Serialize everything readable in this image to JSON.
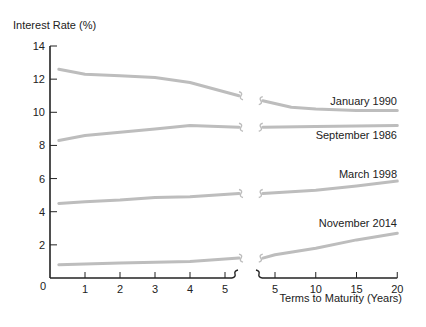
{
  "chart_data": {
    "type": "line",
    "title": "",
    "ylabel": "Interest Rate (%)",
    "xlabel": "Terms to Maturity (Years)",
    "ylim": [
      0,
      14
    ],
    "yticks": [
      0,
      2,
      4,
      6,
      8,
      10,
      12,
      14
    ],
    "x_segments": [
      {
        "range": [
          0,
          5.5
        ],
        "ticks": [
          1,
          2,
          3,
          4,
          5
        ]
      },
      {
        "range": [
          3.5,
          20
        ],
        "ticks": [
          5,
          10,
          15,
          20
        ]
      }
    ],
    "axis_break": true,
    "grid": false,
    "line_color": "#bdbdbd",
    "series": [
      {
        "name": "January 1990",
        "left": {
          "x": [
            0.25,
            1,
            2,
            3,
            4,
            5.4
          ],
          "y": [
            12.6,
            12.3,
            12.2,
            12.1,
            11.8,
            11.0
          ]
        },
        "right": {
          "x": [
            3.5,
            7,
            10,
            15,
            20
          ],
          "y": [
            10.7,
            10.3,
            10.2,
            10.1,
            10.1
          ]
        },
        "label_pos": {
          "x": 397,
          "y": 105,
          "anchor": "end"
        }
      },
      {
        "name": "September 1986",
        "left": {
          "x": [
            0.25,
            1,
            2,
            3,
            4,
            5.4
          ],
          "y": [
            8.3,
            8.6,
            8.8,
            9.0,
            9.2,
            9.1
          ]
        },
        "right": {
          "x": [
            3.5,
            10,
            20
          ],
          "y": [
            9.1,
            9.15,
            9.2
          ]
        },
        "label_pos": {
          "x": 397,
          "y": 139,
          "anchor": "end"
        }
      },
      {
        "name": "March 1998",
        "left": {
          "x": [
            0.25,
            1,
            2,
            3,
            4,
            5.4
          ],
          "y": [
            4.5,
            4.6,
            4.7,
            4.85,
            4.9,
            5.1
          ]
        },
        "right": {
          "x": [
            3.5,
            7,
            10,
            15,
            20
          ],
          "y": [
            5.1,
            5.2,
            5.3,
            5.55,
            5.85
          ]
        },
        "label_pos": {
          "x": 397,
          "y": 178,
          "anchor": "end"
        }
      },
      {
        "name": "November 2014",
        "left": {
          "x": [
            0.25,
            1,
            2,
            3,
            4,
            5.4
          ],
          "y": [
            0.8,
            0.85,
            0.9,
            0.95,
            1.0,
            1.2
          ]
        },
        "right": {
          "x": [
            3.5,
            5,
            10,
            15,
            20
          ],
          "y": [
            1.2,
            1.4,
            1.8,
            2.3,
            2.7
          ]
        },
        "label_pos": {
          "x": 397,
          "y": 227,
          "anchor": "end"
        }
      }
    ],
    "legend": "inline labels at right end of each series"
  }
}
